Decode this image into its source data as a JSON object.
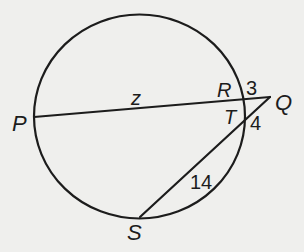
{
  "figure": {
    "background": "#efefed",
    "stroke_color": "#1c1c1c",
    "circle": {
      "cx": 139.5,
      "cy": 116.5,
      "rx": 105.5,
      "ry": 102
    },
    "points": {
      "P": {
        "label": "P",
        "x": 34,
        "y": 117
      },
      "R": {
        "label": "R",
        "x": 244,
        "y": 101
      },
      "Q": {
        "label": "Q",
        "x": 270,
        "y": 97
      },
      "T": {
        "label": "T",
        "x": 245,
        "y": 120
      },
      "S": {
        "label": "S",
        "x": 140,
        "y": 217
      }
    },
    "segments": [
      {
        "from": "P",
        "to": "Q",
        "name": "secant-PQ"
      },
      {
        "from": "S",
        "to": "Q",
        "name": "secant-SQ"
      }
    ],
    "measures": {
      "PR": "z",
      "RQ": "3",
      "TQ": "4",
      "ST": "14"
    }
  }
}
